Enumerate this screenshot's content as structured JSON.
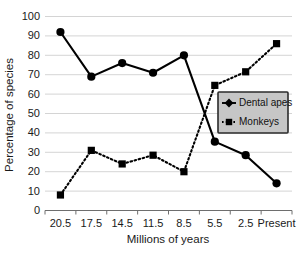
{
  "chart_data": {
    "type": "line",
    "title": "",
    "xlabel": "Millions of  years",
    "ylabel": "Percentage of species",
    "categories": [
      "20.5",
      "17.5",
      "14.5",
      "11.5",
      "8.5",
      "5.5",
      "2.5",
      "Present"
    ],
    "ylim": [
      0,
      100
    ],
    "ytick_values": [
      0,
      10,
      20,
      30,
      40,
      50,
      60,
      70,
      80,
      90,
      100
    ],
    "ytick_labels": [
      "0",
      "10",
      "20",
      "30",
      "40",
      "50",
      "60",
      "70",
      "80",
      "90",
      "100"
    ],
    "grid": "horizontal",
    "legend_position": "center-right",
    "series": [
      {
        "name": "Dental apes",
        "marker": "circle",
        "linestyle": "solid",
        "color": "#000000",
        "values": [
          92,
          69,
          76,
          71,
          80,
          35.5,
          28.5,
          14
        ]
      },
      {
        "name": "Monkeys",
        "marker": "square",
        "linestyle": "dotted",
        "color": "#000000",
        "values": [
          8,
          31,
          24,
          28.5,
          20,
          64.5,
          71.5,
          86
        ]
      }
    ]
  },
  "colors": {
    "background": "#ffffff",
    "gridline": "#c9c9c9",
    "axis": "#6e6e6e",
    "series": "#000000",
    "legend_fill": "#c6c6c6",
    "legend_border": "#2b2b2b",
    "text": "#1a1a1a"
  },
  "legend": {
    "entries": [
      {
        "label": "Dental apes",
        "marker": "diamond-icon"
      },
      {
        "label": "Monkeys",
        "marker": "square-icon"
      }
    ]
  }
}
